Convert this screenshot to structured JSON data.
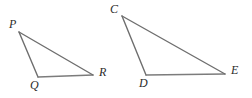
{
  "figure": {
    "name": "two-similar-triangles-diagram",
    "background_color": "#ffffff",
    "stroke_color": "#6e6e6e",
    "label_color": "#2b2b2b",
    "stroke_width": 1.4,
    "width": 252,
    "height": 98
  },
  "triangles": [
    {
      "name": "triangle-pqr",
      "vertices": [
        {
          "label": "P",
          "x": 19,
          "y": 32,
          "label_x": 9,
          "label_y": 18
        },
        {
          "label": "Q",
          "x": 38,
          "y": 77,
          "label_x": 30,
          "label_y": 79
        },
        {
          "label": "R",
          "x": 93,
          "y": 75,
          "label_x": 99,
          "label_y": 66
        }
      ],
      "edges": [
        {
          "name": "edge-pq",
          "from": "P",
          "to": "Q"
        },
        {
          "name": "edge-qr",
          "from": "Q",
          "to": "R"
        },
        {
          "name": "edge-pr",
          "from": "P",
          "to": "R"
        }
      ]
    },
    {
      "name": "triangle-cde",
      "vertices": [
        {
          "label": "C",
          "x": 122,
          "y": 16,
          "label_x": 110,
          "label_y": 3
        },
        {
          "label": "D",
          "x": 146,
          "y": 75,
          "label_x": 139,
          "label_y": 77
        },
        {
          "label": "E",
          "x": 225,
          "y": 74,
          "label_x": 231,
          "label_y": 64
        }
      ],
      "edges": [
        {
          "name": "edge-cd",
          "from": "C",
          "to": "D"
        },
        {
          "name": "edge-de",
          "from": "D",
          "to": "E"
        },
        {
          "name": "edge-ce",
          "from": "C",
          "to": "E"
        }
      ]
    }
  ]
}
